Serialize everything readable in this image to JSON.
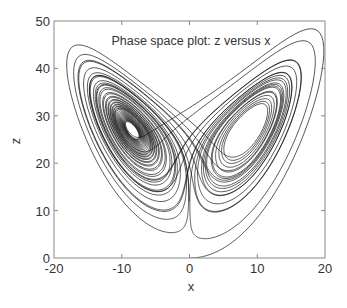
{
  "chart_data": {
    "type": "line",
    "title": "Phase space plot:  z versus x",
    "xlabel": "x",
    "ylabel": "z",
    "xlim": [
      -20,
      20
    ],
    "ylim": [
      0,
      50
    ],
    "xticks": [
      -20,
      -10,
      0,
      10,
      20
    ],
    "yticks": [
      0,
      10,
      20,
      30,
      40,
      50
    ],
    "xtick_labels": [
      "-20",
      "-10",
      "0",
      "10",
      "20"
    ],
    "ytick_labels": [
      "0",
      "10",
      "20",
      "30",
      "40",
      "50"
    ],
    "grid": false,
    "legend": null,
    "series": [
      {
        "name": "Lorenz attractor trajectory (z vs x)",
        "system": "lorenz",
        "parameters": {
          "sigma": 10,
          "rho": 28,
          "beta": 2.6667
        },
        "initial_state": {
          "x": 0.0,
          "y": 1.0,
          "z": 0.0
        },
        "dt": 0.005,
        "steps": 9000,
        "color": "#111111",
        "approx_extents": {
          "x_min": -16.2,
          "x_max": 18.2,
          "z_min": 0.0,
          "z_max": 43.0
        },
        "left_lobe_center": {
          "x": -8.5,
          "z": 24.5
        },
        "right_lobe_center": {
          "x": 8.5,
          "z": 22
        }
      }
    ]
  },
  "colors": {
    "frame": "#888888",
    "text": "#333333",
    "line": "#111111"
  }
}
